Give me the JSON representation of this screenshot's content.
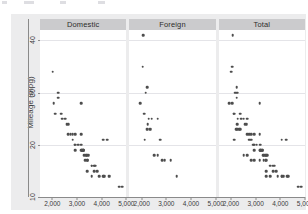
{
  "chart_data": {
    "type": "scatter",
    "title": "",
    "xlabel": "",
    "ylabel": "Mileage (mpg)",
    "xlim": [
      1500,
      5000
    ],
    "ylim": [
      10,
      42
    ],
    "grid": true,
    "legend_position": "none",
    "facet_labels": [
      "Domestic",
      "Foreign",
      "Total"
    ],
    "xticks": [
      2000,
      3000,
      4000,
      5000
    ],
    "xticklabels": [
      "2,000",
      "3,000",
      "4,000",
      "5,000"
    ],
    "yticks": [
      10,
      20,
      30,
      40
    ],
    "yticklabels": [
      "10",
      "20",
      "30",
      "40"
    ],
    "panels": [
      {
        "name": "Domestic",
        "points": [
          [
            2020,
            34
          ],
          [
            2050,
            28
          ],
          [
            2240,
            30
          ],
          [
            2230,
            29
          ],
          [
            2120,
            26
          ],
          [
            2410,
            25
          ],
          [
            2520,
            25
          ],
          [
            2580,
            24
          ],
          [
            2650,
            22
          ],
          [
            2750,
            22
          ],
          [
            2930,
            22
          ],
          [
            3170,
            28
          ],
          [
            2830,
            21
          ],
          [
            3180,
            20
          ],
          [
            3200,
            19
          ],
          [
            3250,
            19
          ],
          [
            3260,
            19
          ],
          [
            3300,
            18
          ],
          [
            3400,
            18
          ],
          [
            3420,
            18
          ],
          [
            3470,
            18
          ],
          [
            2930,
            20
          ],
          [
            3180,
            19
          ],
          [
            3190,
            19
          ],
          [
            3330,
            17
          ],
          [
            3430,
            17
          ],
          [
            3600,
            16
          ],
          [
            3690,
            16
          ],
          [
            3740,
            16
          ],
          [
            3830,
            15
          ],
          [
            3900,
            14
          ],
          [
            4060,
            14
          ],
          [
            4130,
            14
          ],
          [
            4290,
            14
          ],
          [
            4330,
            14
          ],
          [
            4060,
            21
          ],
          [
            4230,
            21
          ],
          [
            4720,
            12
          ],
          [
            4840,
            12
          ],
          [
            3700,
            15
          ],
          [
            3280,
            19
          ],
          [
            3350,
            18
          ],
          [
            2640,
            24
          ],
          [
            2370,
            26
          ],
          [
            3040,
            20
          ],
          [
            2900,
            20
          ],
          [
            3410,
            17
          ],
          [
            3600,
            16
          ],
          [
            4080,
            14
          ],
          [
            2830,
            22
          ],
          [
            3170,
            22
          ],
          [
            2930,
            19
          ],
          [
            3420,
            15
          ],
          [
            3600,
            14
          ]
        ]
      },
      {
        "name": "Foreign",
        "points": [
          [
            2070,
            41
          ],
          [
            2050,
            35
          ],
          [
            2230,
            31
          ],
          [
            2160,
            30
          ],
          [
            1930,
            28
          ],
          [
            2110,
            26
          ],
          [
            2280,
            25
          ],
          [
            2410,
            25
          ],
          [
            2650,
            25
          ],
          [
            2240,
            24
          ],
          [
            2330,
            23
          ],
          [
            2370,
            23
          ],
          [
            2200,
            23
          ],
          [
            2240,
            23
          ],
          [
            2120,
            21
          ],
          [
            2750,
            21
          ],
          [
            2520,
            18
          ],
          [
            2650,
            18
          ],
          [
            2830,
            17
          ],
          [
            2930,
            17
          ],
          [
            3170,
            17
          ],
          [
            3420,
            14
          ]
        ]
      },
      {
        "name": "Total",
        "points": [
          [
            2070,
            41
          ],
          [
            2050,
            35
          ],
          [
            2020,
            34
          ],
          [
            2050,
            28
          ],
          [
            2230,
            31
          ],
          [
            2160,
            30
          ],
          [
            2240,
            30
          ],
          [
            2230,
            29
          ],
          [
            1930,
            28
          ],
          [
            3170,
            28
          ],
          [
            2110,
            26
          ],
          [
            2120,
            26
          ],
          [
            2370,
            26
          ],
          [
            2280,
            25
          ],
          [
            2410,
            25
          ],
          [
            2520,
            25
          ],
          [
            2650,
            25
          ],
          [
            2240,
            24
          ],
          [
            2580,
            24
          ],
          [
            2640,
            24
          ],
          [
            2330,
            23
          ],
          [
            2370,
            23
          ],
          [
            2200,
            23
          ],
          [
            2240,
            23
          ],
          [
            2650,
            22
          ],
          [
            2750,
            22
          ],
          [
            2830,
            22
          ],
          [
            2930,
            22
          ],
          [
            3170,
            22
          ],
          [
            2120,
            21
          ],
          [
            2750,
            21
          ],
          [
            2830,
            21
          ],
          [
            4060,
            21
          ],
          [
            4230,
            21
          ],
          [
            2930,
            20
          ],
          [
            3040,
            20
          ],
          [
            3180,
            20
          ],
          [
            2900,
            20
          ],
          [
            2930,
            19
          ],
          [
            3180,
            19
          ],
          [
            3190,
            19
          ],
          [
            3200,
            19
          ],
          [
            3250,
            19
          ],
          [
            3260,
            19
          ],
          [
            3280,
            19
          ],
          [
            2520,
            18
          ],
          [
            2650,
            18
          ],
          [
            3300,
            18
          ],
          [
            3350,
            18
          ],
          [
            3400,
            18
          ],
          [
            3420,
            18
          ],
          [
            3470,
            18
          ],
          [
            2830,
            17
          ],
          [
            2930,
            17
          ],
          [
            3170,
            17
          ],
          [
            3330,
            17
          ],
          [
            3410,
            17
          ],
          [
            3430,
            17
          ],
          [
            3600,
            16
          ],
          [
            3690,
            16
          ],
          [
            3740,
            16
          ],
          [
            3830,
            15
          ],
          [
            3700,
            15
          ],
          [
            3420,
            15
          ],
          [
            3420,
            14
          ],
          [
            3900,
            14
          ],
          [
            4060,
            14
          ],
          [
            4080,
            14
          ],
          [
            4130,
            14
          ],
          [
            4290,
            14
          ],
          [
            4330,
            14
          ],
          [
            3600,
            14
          ],
          [
            4720,
            12
          ],
          [
            4840,
            12
          ]
        ]
      }
    ]
  },
  "colors": {
    "graph_region_bg": "#ececed",
    "plot_bg": "#ffffff",
    "panel_header_bg": "#cbcbcd",
    "marker": "#4d4d4d",
    "gridline": "#e4e4e8",
    "axis": "#8a8a8a",
    "text": "#3b3b3b"
  }
}
